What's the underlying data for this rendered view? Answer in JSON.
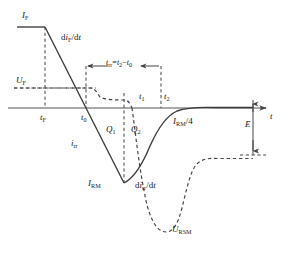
{
  "figure": {
    "axis": {
      "x_label": "t",
      "origin_note": ""
    },
    "colors": {
      "curve": "#3b3b3b",
      "dashed": "#4a4a4a",
      "axis": "#555555",
      "text": "#1a1a1a"
    }
  },
  "labels": {
    "i_f_peak": {
      "sym": "I",
      "sub": "F"
    },
    "di_f_dt": {
      "pre": "d",
      "sym": "i",
      "sub": "F",
      "post": "/d",
      "post_sym": "t"
    },
    "u_f": {
      "sym": "U",
      "sub": "F"
    },
    "t_rr_expr": {
      "sym": "t",
      "sub": "rr",
      "eq": "=",
      "sym2": "t",
      "sub2": "2",
      "minus": "−",
      "sym3": "t",
      "sub3": "0"
    },
    "t_f": {
      "sym": "t",
      "sub": "F"
    },
    "t_0": {
      "sym": "t",
      "sub": "0"
    },
    "t_1": {
      "sym": "t",
      "sub": "1"
    },
    "t_2": {
      "sym": "t",
      "sub": "2"
    },
    "i_rr": {
      "sym": "i",
      "sub": "rr"
    },
    "q1": {
      "sym": "Q",
      "sub": "1"
    },
    "q2": {
      "sym": "Q",
      "sub": "2"
    },
    "i_rm_quarter": {
      "sym": "I",
      "sub": "RM",
      "post": "/4"
    },
    "i_rm": {
      "sym": "I",
      "sub": "RM"
    },
    "di_rr_dt": {
      "pre": "d",
      "sym": "i",
      "sub": "rr",
      "post": "/d",
      "post_sym": "t"
    },
    "u_rsm": {
      "sym": "U",
      "sub": "RSM"
    },
    "e": {
      "sym": "E"
    },
    "t_axis": {
      "sym": "t"
    }
  }
}
